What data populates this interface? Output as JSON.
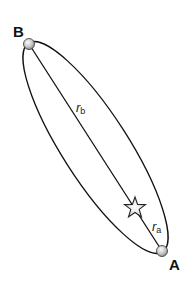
{
  "diagram": {
    "type": "elliptical-orbit",
    "points": {
      "B": {
        "label": "B"
      },
      "A": {
        "label": "A"
      }
    },
    "distances": {
      "rb": {
        "symbol": "r",
        "subscript": "b"
      },
      "ra": {
        "symbol": "r",
        "subscript": "a"
      }
    },
    "focus": {
      "icon": "star-icon"
    },
    "colors": {
      "stroke": "#111111",
      "planet_fill_light": "#f4f4f4",
      "planet_fill_dark": "#9a9a9a",
      "star_fill": "#e6e6e6"
    }
  }
}
